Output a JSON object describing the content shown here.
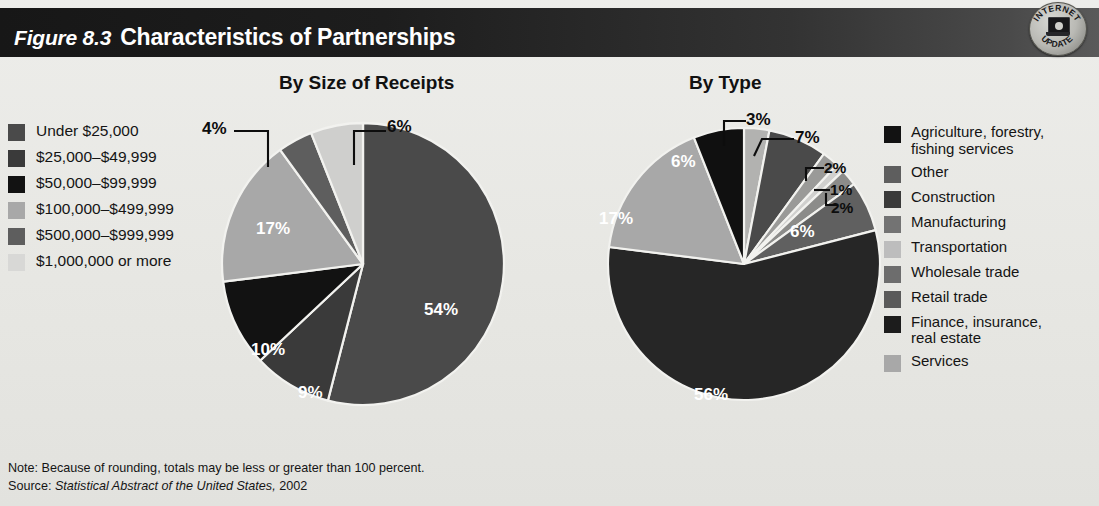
{
  "header": {
    "figure_number": "Figure 8.3",
    "title": "Characteristics of Partnerships",
    "badge": {
      "top_text": "INTERNET",
      "bottom_text": "UPDATE",
      "icon": "laptop-icon"
    }
  },
  "footer": {
    "note": "Note: Because of rounding, totals may be less or greater than 100 percent.",
    "source_prefix": "Source: ",
    "source_italic": "Statistical Abstract of the United States,",
    "source_year": " 2002"
  },
  "colors": {
    "background": "#e9e9e6",
    "header_dark": "#1a1a1a",
    "slice_black": "#121212",
    "slice_darkest": "#262626",
    "slice_dark": "#3a3a3a",
    "slice_medium_dark": "#4a4a4a",
    "slice_medium": "#5e5e5e",
    "slice_mid_gray": "#737373",
    "slice_gray": "#8a8a8a",
    "slice_light": "#a8a8a8",
    "slice_lighter": "#bdbdbd",
    "slice_lightest": "#d2d2d0"
  },
  "chart_data": [
    {
      "type": "pie",
      "id": "by-size-of-receipts",
      "title": "By Size of Receipts",
      "legend_position": "left",
      "categories": [
        "Under $25,000",
        "$25,000–$49,999",
        "$50,000–$99,999",
        "$100,000–$499,999",
        "$500,000–$999,999",
        "$1,000,000 or more"
      ],
      "values": [
        54,
        9,
        10,
        17,
        4,
        6
      ],
      "value_labels": [
        "54%",
        "9%",
        "10%",
        "17%",
        "4%",
        "6%"
      ],
      "slice_colors": [
        "#4a4a4a",
        "#3a3a3a",
        "#121212",
        "#a8a8a8",
        "#5e5e5e",
        "#cfcfcd"
      ],
      "legend_swatch_colors": [
        "#4a4a4a",
        "#3a3a3a",
        "#121212",
        "#a8a8a8",
        "#5e5e5e",
        "#d8d8d6"
      ],
      "label_placement": [
        "inside",
        "inside",
        "inside",
        "inside",
        "callout",
        "callout"
      ],
      "start_angle_deg": 0,
      "direction": "clockwise"
    },
    {
      "type": "pie",
      "id": "by-type",
      "title": "By Type",
      "legend_position": "right",
      "categories": [
        "Agriculture, forestry, fishing services",
        "Other",
        "Construction",
        "Manufacturing",
        "Transportation",
        "Wholesale trade",
        "Retail trade",
        "Finance, insurance, real estate",
        "Services"
      ],
      "legend_lines": [
        [
          "Agriculture, forestry,",
          "fishing services"
        ],
        [
          "Other"
        ],
        [
          "Construction"
        ],
        [
          "Manufacturing"
        ],
        [
          "Transportation"
        ],
        [
          "Wholesale trade"
        ],
        [
          "Retail trade"
        ],
        [
          "Finance, insurance,",
          "real estate"
        ],
        [
          "Services"
        ]
      ],
      "values": [
        3,
        7,
        2,
        1,
        2,
        6,
        56,
        17,
        6
      ],
      "value_labels": [
        "3%",
        "7%",
        "2%",
        "1%",
        "2%",
        "6%",
        "56%",
        "17%",
        "6%"
      ],
      "slice_colors": [
        "#b2b2b0",
        "#4a4a4a",
        "#9a9a98",
        "#d0d0ce",
        "#8c8c8a",
        "#606060",
        "#262626",
        "#a8a8a8",
        "#101010"
      ],
      "legend_swatch_colors": [
        "#121212",
        "#5e5e5e",
        "#3a3a3a",
        "#737373",
        "#bdbdbd",
        "#6d6d6d",
        "#5a5a5a",
        "#1c1c1c",
        "#a8a8a8"
      ],
      "label_placement": [
        "callout",
        "callout",
        "callout",
        "callout",
        "callout",
        "inside",
        "inside",
        "inside",
        "inside"
      ],
      "start_angle_deg": 0,
      "direction": "clockwise"
    }
  ]
}
